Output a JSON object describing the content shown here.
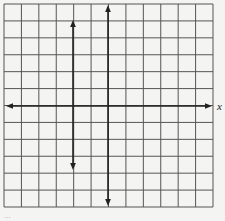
{
  "diagram": {
    "type": "coordinate-grid",
    "grid": {
      "left": 4,
      "top": 4,
      "right": 213,
      "bottom": 207,
      "columns": 12,
      "rows": 12,
      "line_color": "#555555",
      "background": "#f4f4f2"
    },
    "x_axis": {
      "y": 106,
      "x_start": 6,
      "x_end": 212,
      "label": "x",
      "arrows": "both"
    },
    "vertical_lines": [
      {
        "x": 73,
        "y_start": 20,
        "y_end": 170,
        "arrows": "both"
      },
      {
        "x": 108,
        "y_start": 5,
        "y_end": 206,
        "arrows": "both"
      }
    ],
    "axis_color": "#222222",
    "caption": "..."
  }
}
